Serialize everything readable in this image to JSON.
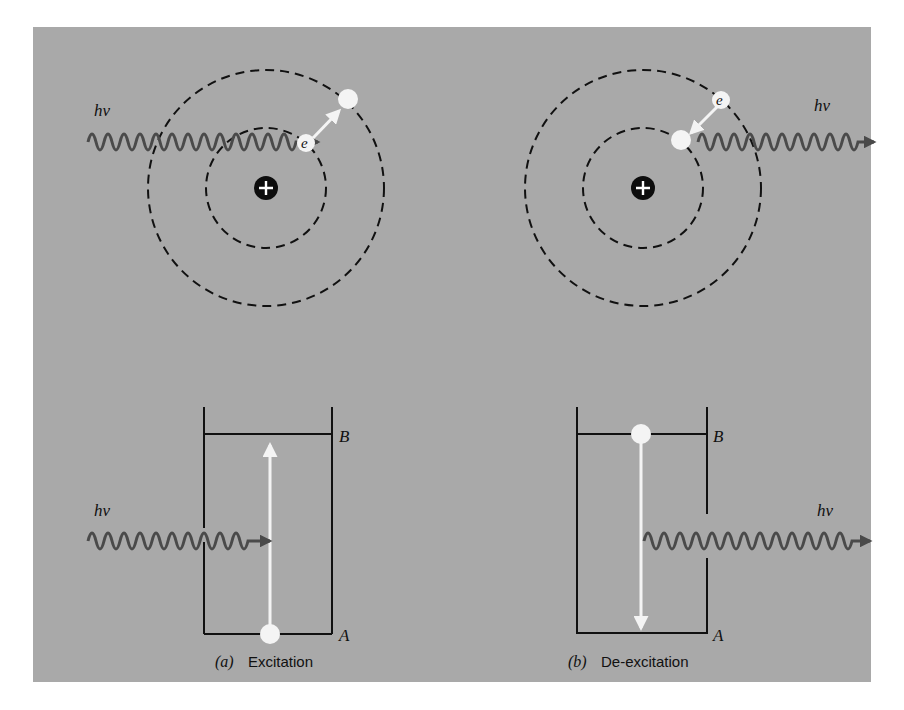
{
  "figure": {
    "background_color": "#a9a9a9",
    "orbit_color": "#111111",
    "photon_color": "#4a4a4a",
    "electron_color": "#f4f4f4",
    "nucleus_symbol": "+",
    "photon_label": "hν",
    "electron_label": "e"
  },
  "panel_a": {
    "atom": {
      "photon_label": "hν",
      "electron_label": "e",
      "description": "Incoming photon excites electron from inner orbit to outer orbit"
    },
    "energy_levels": {
      "upper_label": "B",
      "lower_label": "A",
      "photon_label": "hν",
      "transition": "A → B (upward)"
    },
    "caption_letter": "(a)",
    "caption_text": "Excitation"
  },
  "panel_b": {
    "atom": {
      "photon_label": "hν",
      "electron_label": "e",
      "description": "Electron drops from outer orbit to inner orbit emitting photon"
    },
    "energy_levels": {
      "upper_label": "B",
      "lower_label": "A",
      "photon_label": "hν",
      "transition": "B → A (downward)"
    },
    "caption_letter": "(b)",
    "caption_text": "De-excitation"
  }
}
